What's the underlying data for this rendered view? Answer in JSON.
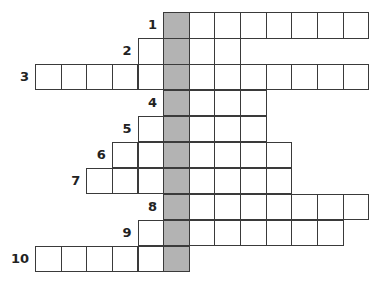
{
  "puzzle": {
    "type": "crossword",
    "highlight_column": 5,
    "colors": {
      "cell_fill": "#ffffff",
      "key_column_fill": "#b3b3b3",
      "border": "#3a3a3a",
      "number": "#222222"
    },
    "rows": [
      {
        "number": "1",
        "start_col": 5,
        "end_col": 12
      },
      {
        "number": "2",
        "start_col": 4,
        "end_col": 7
      },
      {
        "number": "3",
        "start_col": 0,
        "end_col": 12
      },
      {
        "number": "4",
        "start_col": 5,
        "end_col": 8
      },
      {
        "number": "5",
        "start_col": 4,
        "end_col": 8
      },
      {
        "number": "6",
        "start_col": 3,
        "end_col": 9
      },
      {
        "number": "7",
        "start_col": 2,
        "end_col": 9
      },
      {
        "number": "8",
        "start_col": 5,
        "end_col": 12
      },
      {
        "number": "9",
        "start_col": 4,
        "end_col": 11
      },
      {
        "number": "10",
        "start_col": 0,
        "end_col": 5
      }
    ]
  }
}
